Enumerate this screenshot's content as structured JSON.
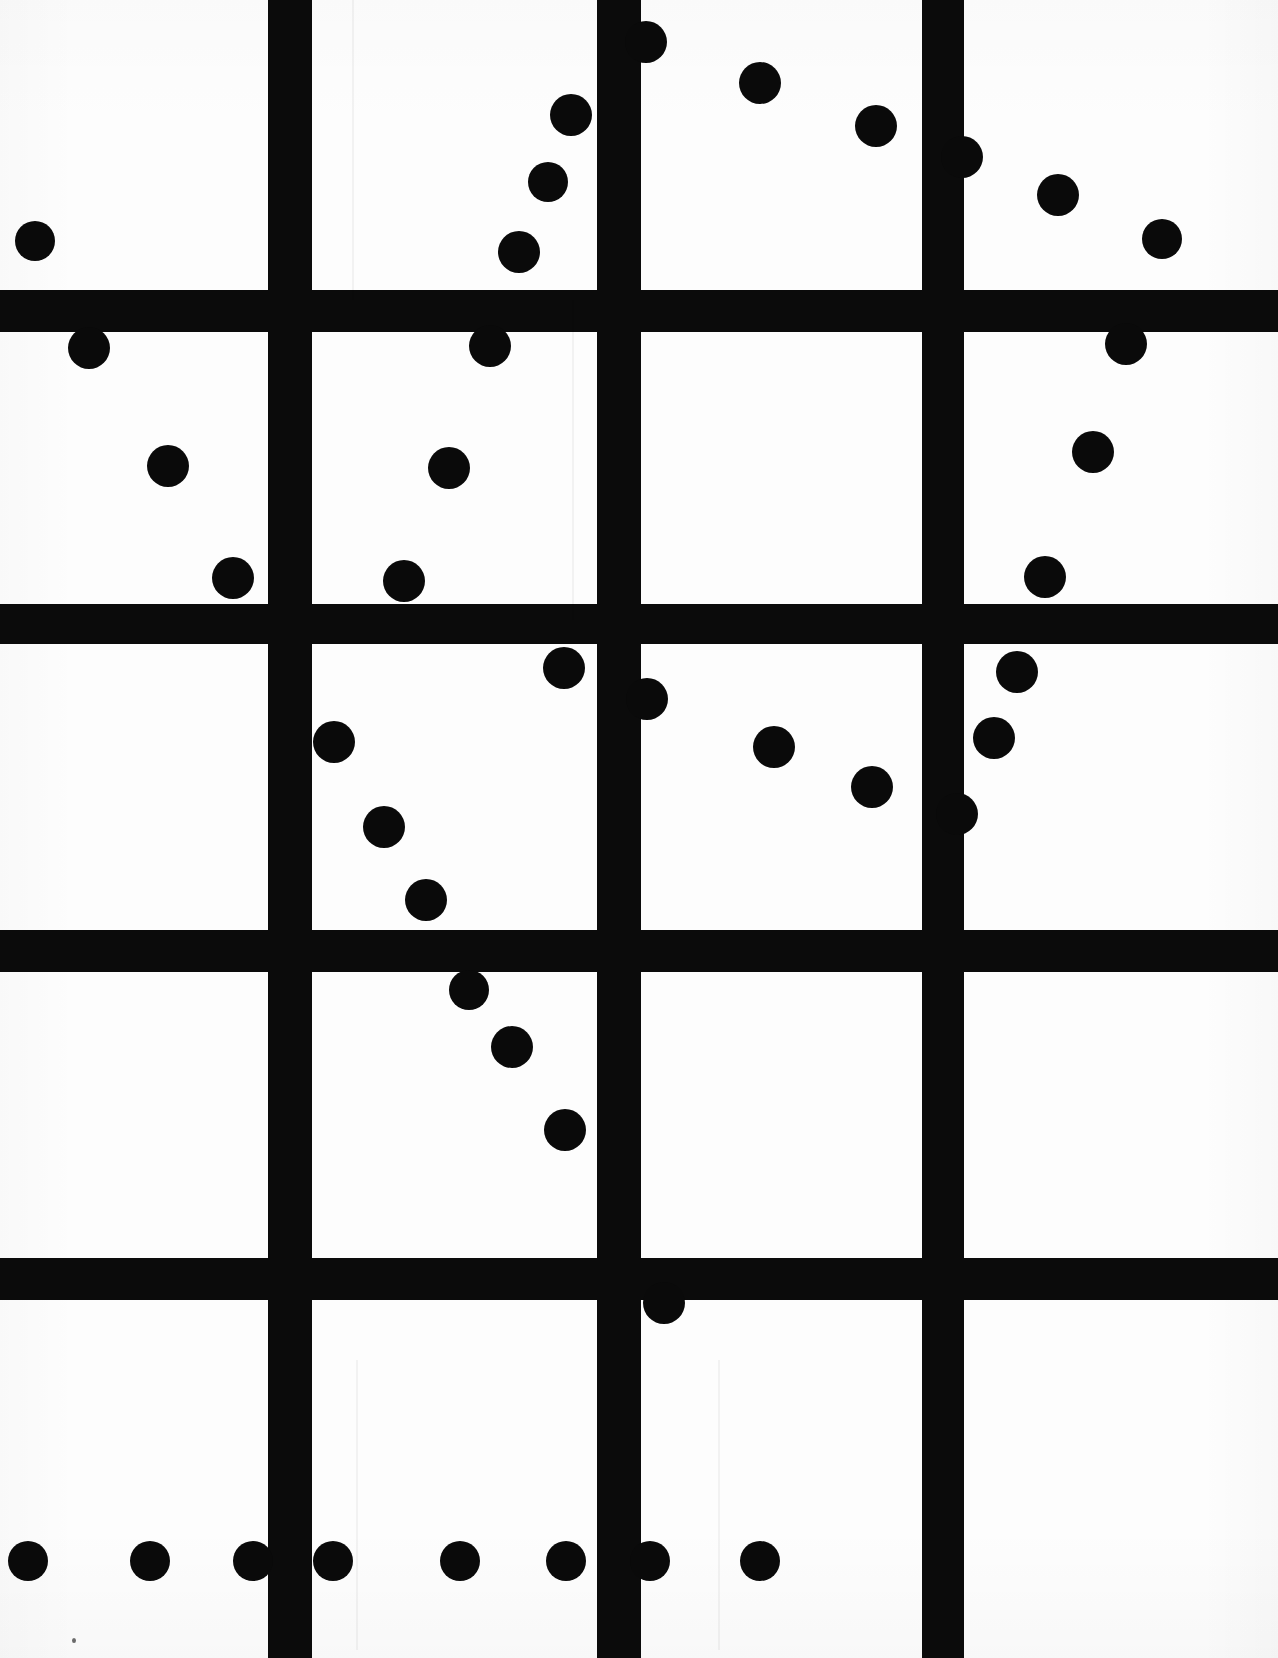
{
  "document": {
    "kind": "scanned-test-pattern",
    "title": "Dot and grid scan pattern",
    "width": 1278,
    "height": 1658,
    "background_color": "#ffffff",
    "ink_color": "#0a0a0a"
  },
  "grid": {
    "line_color": "#0b0b0b",
    "vertical_lines": [
      {
        "name": "vertical-line-1",
        "x": 268,
        "width": 44,
        "y": 0,
        "height": 1658
      },
      {
        "name": "vertical-line-2",
        "x": 597,
        "width": 44,
        "y": 0,
        "height": 1658
      },
      {
        "name": "vertical-line-3",
        "x": 922,
        "width": 42,
        "y": 0,
        "height": 1658
      }
    ],
    "horizontal_lines": [
      {
        "name": "horizontal-line-1",
        "y": 290,
        "height": 42,
        "x": 0,
        "width": 1278
      },
      {
        "name": "horizontal-line-2",
        "y": 604,
        "height": 40,
        "x": 0,
        "width": 1278
      },
      {
        "name": "horizontal-line-3",
        "y": 930,
        "height": 42,
        "x": 0,
        "width": 1278
      },
      {
        "name": "horizontal-line-4",
        "y": 1258,
        "height": 42,
        "x": 0,
        "width": 1278
      }
    ]
  },
  "dots": {
    "color": "#0a0a0a",
    "items": [
      {
        "id": "dot-01",
        "cx": 35,
        "cy": 241,
        "r": 20
      },
      {
        "id": "dot-02",
        "cx": 646,
        "cy": 42,
        "r": 21
      },
      {
        "id": "dot-03",
        "cx": 760,
        "cy": 83,
        "r": 21
      },
      {
        "id": "dot-04",
        "cx": 571,
        "cy": 115,
        "r": 21
      },
      {
        "id": "dot-05",
        "cx": 876,
        "cy": 126,
        "r": 21
      },
      {
        "id": "dot-06",
        "cx": 962,
        "cy": 157,
        "r": 21
      },
      {
        "id": "dot-07",
        "cx": 548,
        "cy": 182,
        "r": 20
      },
      {
        "id": "dot-08",
        "cx": 1058,
        "cy": 195,
        "r": 21
      },
      {
        "id": "dot-09",
        "cx": 519,
        "cy": 252,
        "r": 21
      },
      {
        "id": "dot-10",
        "cx": 1162,
        "cy": 239,
        "r": 20
      },
      {
        "id": "dot-11",
        "cx": 89,
        "cy": 348,
        "r": 21
      },
      {
        "id": "dot-12",
        "cx": 490,
        "cy": 346,
        "r": 21
      },
      {
        "id": "dot-13",
        "cx": 1126,
        "cy": 344,
        "r": 21
      },
      {
        "id": "dot-14",
        "cx": 168,
        "cy": 466,
        "r": 21
      },
      {
        "id": "dot-15",
        "cx": 449,
        "cy": 468,
        "r": 21
      },
      {
        "id": "dot-16",
        "cx": 1093,
        "cy": 452,
        "r": 21
      },
      {
        "id": "dot-17",
        "cx": 233,
        "cy": 578,
        "r": 21
      },
      {
        "id": "dot-18",
        "cx": 404,
        "cy": 581,
        "r": 21
      },
      {
        "id": "dot-19",
        "cx": 1045,
        "cy": 577,
        "r": 21
      },
      {
        "id": "dot-20",
        "cx": 564,
        "cy": 668,
        "r": 21
      },
      {
        "id": "dot-21",
        "cx": 647,
        "cy": 699,
        "r": 21
      },
      {
        "id": "dot-22",
        "cx": 1017,
        "cy": 672,
        "r": 21
      },
      {
        "id": "dot-23",
        "cx": 334,
        "cy": 742,
        "r": 21
      },
      {
        "id": "dot-24",
        "cx": 774,
        "cy": 747,
        "r": 21
      },
      {
        "id": "dot-25",
        "cx": 994,
        "cy": 738,
        "r": 21
      },
      {
        "id": "dot-26",
        "cx": 872,
        "cy": 787,
        "r": 21
      },
      {
        "id": "dot-27",
        "cx": 384,
        "cy": 827,
        "r": 21
      },
      {
        "id": "dot-28",
        "cx": 957,
        "cy": 814,
        "r": 21
      },
      {
        "id": "dot-29",
        "cx": 426,
        "cy": 900,
        "r": 21
      },
      {
        "id": "dot-30",
        "cx": 469,
        "cy": 990,
        "r": 20
      },
      {
        "id": "dot-31",
        "cx": 512,
        "cy": 1047,
        "r": 21
      },
      {
        "id": "dot-32",
        "cx": 565,
        "cy": 1130,
        "r": 21
      },
      {
        "id": "dot-33",
        "cx": 664,
        "cy": 1303,
        "r": 21
      },
      {
        "id": "dot-34",
        "cx": 28,
        "cy": 1561,
        "r": 20
      },
      {
        "id": "dot-35",
        "cx": 150,
        "cy": 1561,
        "r": 20
      },
      {
        "id": "dot-36",
        "cx": 253,
        "cy": 1561,
        "r": 20
      },
      {
        "id": "dot-37",
        "cx": 333,
        "cy": 1561,
        "r": 20
      },
      {
        "id": "dot-38",
        "cx": 460,
        "cy": 1561,
        "r": 20
      },
      {
        "id": "dot-39",
        "cx": 566,
        "cy": 1561,
        "r": 20
      },
      {
        "id": "dot-40",
        "cx": 650,
        "cy": 1561,
        "r": 20
      },
      {
        "id": "dot-41",
        "cx": 760,
        "cy": 1561,
        "r": 20
      }
    ]
  },
  "artifacts": {
    "speck": {
      "name": "scan-speck",
      "x": 72,
      "y": 1638
    },
    "streaks": [
      {
        "name": "scan-streak-1",
        "x": 352,
        "y": 0,
        "width": 2,
        "height": 300
      },
      {
        "name": "scan-streak-2",
        "x": 572,
        "y": 300,
        "width": 2,
        "height": 320
      },
      {
        "name": "scan-streak-3",
        "x": 718,
        "y": 1360,
        "width": 2,
        "height": 290
      },
      {
        "name": "scan-streak-4",
        "x": 356,
        "y": 1360,
        "width": 2,
        "height": 290
      }
    ]
  }
}
